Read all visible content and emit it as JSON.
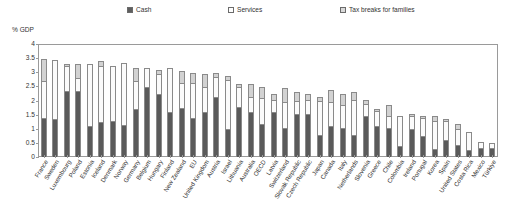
{
  "legend": {
    "items": [
      {
        "label": "Cash",
        "icon": "filled-square-swatch-icon",
        "color": "#5e5e5e"
      },
      {
        "label": "Services",
        "icon": "open-square-swatch-icon",
        "color": "#fdfdfd"
      },
      {
        "label": "Tax breaks for families",
        "icon": "hatched-square-swatch-icon",
        "color": "#d9d9d9"
      }
    ]
  },
  "axis": {
    "unit_caption": "% GDP",
    "y_ticks": [
      "0",
      "0.5",
      "1",
      "1.5",
      "2",
      "2.5",
      "3",
      "3.5",
      "4"
    ]
  },
  "chart_data": {
    "type": "bar",
    "subtype": "stacked-vertical",
    "title": "",
    "subtitle": "",
    "xlabel": "",
    "ylabel": "% GDP",
    "ylim": [
      0,
      4
    ],
    "ytick_step": 0.5,
    "grid": false,
    "legend_position": "top",
    "categories": [
      "France",
      "Sweden",
      "Luxembourg",
      "Poland",
      "Estonia",
      "Iceland",
      "Denmark",
      "Norway",
      "Germany",
      "Belgium",
      "Hungary",
      "Finland",
      "New Zealand",
      "EU",
      "United Kingdom",
      "Austria",
      "Israel",
      "Lithuania",
      "Australia",
      "OECD",
      "Latvia",
      "Switzerland",
      "Slovak Republic",
      "Czech Republic",
      "Japan",
      "Canada",
      "Italy",
      "Netherlands",
      "Slovenia",
      "Greece",
      "Chile",
      "Colombia",
      "Ireland",
      "Portugal",
      "Korea",
      "Spain",
      "United States",
      "Costa Rica",
      "Mexico",
      "Türkiye"
    ],
    "series": [
      {
        "name": "Cash",
        "color": "#5a5a5a",
        "values": [
          1.35,
          1.3,
          2.3,
          2.3,
          1.05,
          1.2,
          1.25,
          1.1,
          1.65,
          2.45,
          2.2,
          1.55,
          1.7,
          1.35,
          1.55,
          2.1,
          0.95,
          1.75,
          1.55,
          1.15,
          1.55,
          1.0,
          1.5,
          1.5,
          0.75,
          1.05,
          1.0,
          0.75,
          1.4,
          1.05,
          1.0,
          0.35,
          0.95,
          0.7,
          0.25,
          0.55,
          0.4,
          0.2,
          0.3,
          0.3
        ]
      },
      {
        "name": "Services",
        "color": "#fbfbfb",
        "values": [
          1.3,
          2.1,
          0.9,
          0.45,
          2.2,
          2.0,
          1.95,
          2.2,
          1.0,
          0.65,
          0.7,
          1.55,
          0.9,
          1.25,
          0.9,
          0.7,
          1.75,
          0.7,
          0.55,
          0.9,
          0.45,
          0.9,
          0.45,
          0.5,
          1.2,
          0.85,
          0.8,
          1.25,
          0.45,
          0.55,
          0.4,
          1.05,
          0.45,
          0.65,
          1.0,
          0.7,
          0.55,
          0.65,
          0.2,
          0.15
        ]
      },
      {
        "name": "Tax breaks for families",
        "color": "#d2d2d2",
        "values": [
          0.8,
          0.0,
          0.05,
          0.5,
          0.0,
          0.15,
          0.0,
          0.0,
          0.45,
          0.0,
          0.15,
          0.0,
          0.4,
          0.35,
          0.45,
          0.15,
          0.15,
          0.1,
          0.45,
          0.4,
          0.2,
          0.5,
          0.3,
          0.2,
          0.15,
          0.45,
          0.4,
          0.25,
          0.15,
          0.05,
          0.4,
          0.0,
          0.1,
          0.05,
          0.15,
          0.05,
          0.2,
          0.0,
          0.0,
          0.0
        ]
      }
    ],
    "totals": [
      3.45,
      3.4,
      3.25,
      3.25,
      3.25,
      3.35,
      3.2,
      3.3,
      3.1,
      3.1,
      3.05,
      3.1,
      3.0,
      2.95,
      2.9,
      2.95,
      2.85,
      2.55,
      2.55,
      2.45,
      2.2,
      2.4,
      2.25,
      2.2,
      2.1,
      2.35,
      2.2,
      2.25,
      2.0,
      1.65,
      1.8,
      1.4,
      1.5,
      1.4,
      1.4,
      1.3,
      1.15,
      0.85,
      0.5,
      0.45
    ]
  }
}
